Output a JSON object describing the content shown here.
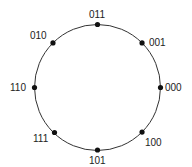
{
  "diagram": {
    "type": "gray-code-circle",
    "center": [
      97.5,
      87.5
    ],
    "radius": 63,
    "stroke_color": "#333333",
    "dot_color": "#111111",
    "nodes": [
      {
        "label": "000",
        "angle_deg": 0
      },
      {
        "label": "001",
        "angle_deg": 45
      },
      {
        "label": "011",
        "angle_deg": 90
      },
      {
        "label": "010",
        "angle_deg": 135
      },
      {
        "label": "110",
        "angle_deg": 180
      },
      {
        "label": "111",
        "angle_deg": 225
      },
      {
        "label": "101",
        "angle_deg": 270
      },
      {
        "label": "100",
        "angle_deg": 315
      }
    ]
  }
}
